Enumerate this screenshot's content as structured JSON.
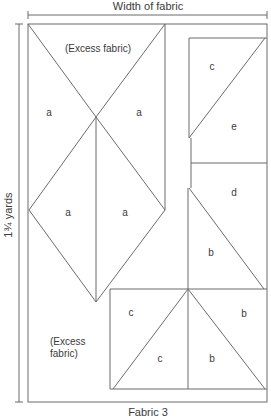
{
  "diagram": {
    "title_top": "Width of fabric",
    "title_side": "1¾ yards",
    "caption": "Fabric 3",
    "excess_top": "(Excess fabric)",
    "excess_bottom_line1": "(Excess",
    "excess_bottom_line2": "fabric)",
    "pieces": {
      "a1": "a",
      "a2": "a",
      "a3": "a",
      "a4": "a",
      "c1": "c",
      "e": "e",
      "d": "d",
      "b1": "b",
      "c2": "c",
      "c3": "c",
      "b2": "b",
      "b3": "b"
    },
    "colors": {
      "line": "#6b6b6b",
      "text": "#3a3a3a",
      "background": "#ffffff"
    }
  }
}
